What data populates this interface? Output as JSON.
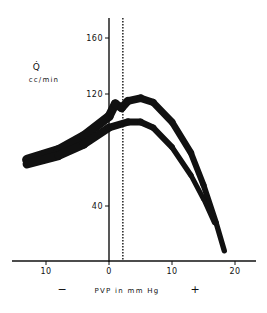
{
  "chart_data": {
    "type": "line",
    "title": "",
    "xlabel": "PVP in mm Hg",
    "xlabel_minus": "−",
    "xlabel_plus": "+",
    "ylabel_symbol": "Q̇",
    "ylabel_units": "cc/min",
    "x_ticks": [
      {
        "value": -10,
        "label": "10"
      },
      {
        "value": 0,
        "label": "0"
      },
      {
        "value": 10,
        "label": "10"
      },
      {
        "value": 20,
        "label": "20"
      }
    ],
    "y_ticks": [
      {
        "value": 40,
        "label": "40"
      },
      {
        "value": 120,
        "label": "120"
      },
      {
        "value": 160,
        "label": "160"
      }
    ],
    "xlim": [
      -16,
      24
    ],
    "ylim": [
      0,
      170
    ],
    "grid": false,
    "reference_line": {
      "x": 2.2,
      "style": "dotted"
    },
    "series": [
      {
        "name": "upper curve",
        "x": [
          -13,
          -8,
          -4,
          0,
          1,
          2,
          3,
          5,
          7,
          10,
          13,
          15,
          17,
          18.3
        ],
        "y": [
          73,
          80,
          90,
          104,
          113,
          110,
          115,
          117,
          114,
          100,
          78,
          55,
          28,
          8
        ]
      },
      {
        "name": "lower curve",
        "x": [
          -13,
          -8,
          -4,
          0,
          3,
          5,
          7,
          10,
          13,
          15,
          16.7
        ],
        "y": [
          70,
          76,
          84,
          96,
          100,
          100,
          96,
          82,
          62,
          45,
          28
        ]
      }
    ],
    "color": "#111111"
  }
}
